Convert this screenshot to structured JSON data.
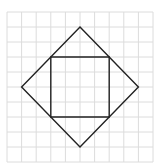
{
  "diagram": {
    "type": "geometry-on-grid",
    "grid": {
      "columns": 10,
      "rows": 10,
      "origin_px": [
        7,
        12
      ],
      "cell_w": 14.6,
      "cell_h": 15.0,
      "line_color": "#dcdcdc"
    },
    "shapes": [
      {
        "name": "outer-diamond",
        "kind": "square-rotated-45",
        "vertices_grid": [
          [
            5,
            1
          ],
          [
            9,
            5
          ],
          [
            5,
            9
          ],
          [
            1,
            5
          ]
        ],
        "stroke": "#222222"
      },
      {
        "name": "inner-square",
        "kind": "square",
        "vertices_grid": [
          [
            3,
            3
          ],
          [
            7,
            3
          ],
          [
            7,
            7
          ],
          [
            3,
            7
          ]
        ],
        "stroke": "#222222"
      }
    ]
  }
}
